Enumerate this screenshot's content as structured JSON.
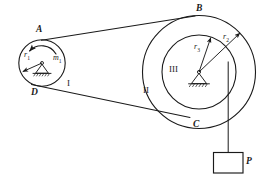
{
  "figure": {
    "stroke_color": "#1a1a1a",
    "background_color": "#ffffff"
  },
  "points": {
    "a": "A",
    "b": "B",
    "c": "C",
    "d": "D"
  },
  "bodies": {
    "pulley_small": "I",
    "pulley_large_outer": "II",
    "pulley_large_inner": "III"
  },
  "radii": {
    "r1": "r",
    "r1_sub": "1",
    "r2": "r",
    "r2_sub": "2",
    "r3": "r",
    "r3_sub": "3"
  },
  "moment": {
    "m1": "m",
    "m1_sub": "1"
  },
  "load": {
    "label": "P"
  },
  "icons": {
    "pin_support_small": "pin-support-icon",
    "pin_support_large": "pin-support-icon",
    "moment_arc": "moment-arrow-icon",
    "weight_block": "weight-block-icon"
  }
}
